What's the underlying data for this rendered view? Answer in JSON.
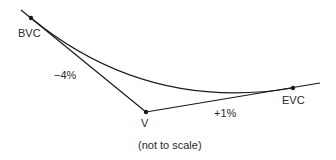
{
  "diagram": {
    "type": "sag vertical curve",
    "points": {
      "bvc": {
        "label": "BVC"
      },
      "v": {
        "label": "V"
      },
      "evc": {
        "label": "EVC"
      }
    },
    "grades": {
      "incoming": "−4%",
      "outgoing": "+1%"
    },
    "caption": "(not to scale)",
    "colors": {
      "line": "#1a1a1a",
      "text": "#2a2a2a",
      "background": "#ffffff"
    }
  }
}
